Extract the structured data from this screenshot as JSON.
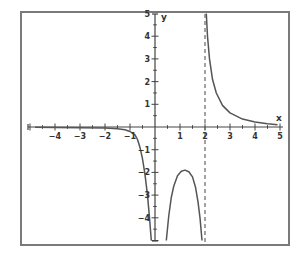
{
  "chart_data": {
    "type": "line",
    "title": "",
    "xlabel": "x",
    "ylabel": "y",
    "xlim": [
      -5,
      5
    ],
    "ylim": [
      -5,
      5
    ],
    "grid": false,
    "x_ticks": [
      -4,
      -3,
      -2,
      -1,
      1,
      2,
      3,
      4,
      5
    ],
    "y_ticks": [
      5,
      4,
      3,
      2,
      1,
      -1,
      -2,
      -3,
      -4
    ],
    "vertical_asymptote_dashed": 2,
    "series": [
      {
        "name": "left-branch",
        "points": [
          [
            -4.8,
            -0.01
          ],
          [
            -4,
            -0.02
          ],
          [
            -3,
            -0.03
          ],
          [
            -2,
            -0.05
          ],
          [
            -1.5,
            -0.08
          ],
          [
            -1.2,
            -0.12
          ],
          [
            -1,
            -0.2
          ],
          [
            -0.8,
            -0.35
          ],
          [
            -0.7,
            -0.55
          ],
          [
            -0.6,
            -0.9
          ],
          [
            -0.5,
            -1.4
          ],
          [
            -0.4,
            -2.1
          ],
          [
            -0.3,
            -3.0
          ],
          [
            -0.22,
            -4.0
          ],
          [
            -0.15,
            -5.0
          ]
        ]
      },
      {
        "name": "middle-branch",
        "points": [
          [
            0.45,
            -5.0
          ],
          [
            0.55,
            -3.9
          ],
          [
            0.65,
            -3.1
          ],
          [
            0.75,
            -2.6
          ],
          [
            0.9,
            -2.15
          ],
          [
            1.05,
            -1.95
          ],
          [
            1.2,
            -1.9
          ],
          [
            1.35,
            -1.97
          ],
          [
            1.5,
            -2.2
          ],
          [
            1.62,
            -2.65
          ],
          [
            1.72,
            -3.3
          ],
          [
            1.8,
            -4.0
          ],
          [
            1.88,
            -5.0
          ]
        ]
      },
      {
        "name": "right-branch",
        "points": [
          [
            2.05,
            5.0
          ],
          [
            2.1,
            4.0
          ],
          [
            2.18,
            3.0
          ],
          [
            2.3,
            2.1
          ],
          [
            2.45,
            1.5
          ],
          [
            2.7,
            0.95
          ],
          [
            3.0,
            0.62
          ],
          [
            3.5,
            0.35
          ],
          [
            4.0,
            0.22
          ],
          [
            4.5,
            0.14
          ],
          [
            4.9,
            0.1
          ]
        ]
      }
    ]
  },
  "labels": {
    "x_axis": "x",
    "y_axis": "y"
  },
  "colors": {
    "frame": "#7a7a7a",
    "axis": "#444444",
    "curve": "#555555",
    "asymptote": "#666666"
  }
}
